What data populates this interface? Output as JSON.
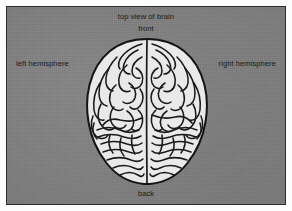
{
  "figure": {
    "kind": "anatomical-diagram",
    "title": "top view of brain",
    "background_color": "#7d7d7d",
    "frame_color": "#2b2b2b",
    "page_color": "#fdfdfd"
  },
  "labels": {
    "title": "top view of brain",
    "front": "front",
    "back": "back",
    "left_hemisphere": "left hemisphere",
    "right_hemisphere": "right hemisphere"
  },
  "brain": {
    "fill_color": "#e9e9e9",
    "outline_color": "#141414",
    "sulci_color": "#1a1a1a",
    "parts": {
      "left_hemisphere": "left hemisphere",
      "right_hemisphere": "right hemisphere",
      "longitudinal_fissure": "longitudinal fissure",
      "anterior": "front",
      "posterior": "back"
    }
  }
}
